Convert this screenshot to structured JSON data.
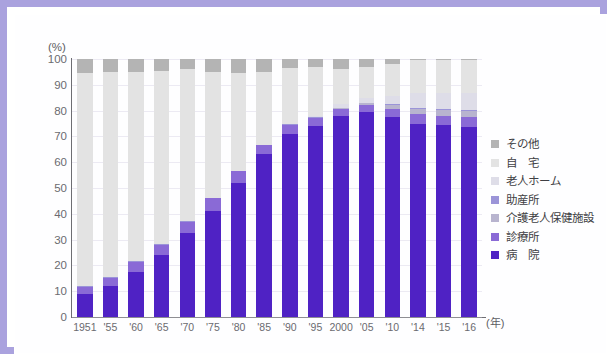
{
  "chart_data": {
    "type": "bar",
    "stacked": true,
    "title": "",
    "subtitle": "",
    "xlabel": "(年)",
    "ylabel": "(%)",
    "ylim": [
      0,
      100
    ],
    "ytick_step": 10,
    "yticks": [
      "100",
      "90",
      "80",
      "70",
      "60",
      "50",
      "40",
      "30",
      "20",
      "10",
      "0"
    ],
    "grid": true,
    "legend_position": "right",
    "categories": [
      "1951",
      "'55",
      "'60",
      "'65",
      "'70",
      "'75",
      "'80",
      "'85",
      "'90",
      "'95",
      "2000",
      "'05",
      "'10",
      "'14",
      "'15",
      "'16"
    ],
    "series": [
      {
        "name": "病 院",
        "color": "#4f22c4",
        "values": [
          9.0,
          12.0,
          17.5,
          24.0,
          32.5,
          41.0,
          52.0,
          63.0,
          71.0,
          74.0,
          78.0,
          79.5,
          77.5,
          75.0,
          74.5,
          73.5
        ]
      },
      {
        "name": "診療所",
        "color": "#8a6ad6",
        "values": [
          2.5,
          3.0,
          4.0,
          4.0,
          4.5,
          5.0,
          4.5,
          3.5,
          3.5,
          3.0,
          2.5,
          2.5,
          3.0,
          3.5,
          3.5,
          4.0
        ]
      },
      {
        "name": "介護老人保健施設",
        "color": "#b8b4cf",
        "values": [
          0.0,
          0.0,
          0.0,
          0.0,
          0.0,
          0.0,
          0.0,
          0.0,
          0.0,
          0.2,
          0.5,
          0.8,
          1.8,
          2.2,
          2.3,
          2.4
        ]
      },
      {
        "name": "助産所",
        "color": "#9b94d8",
        "values": [
          0.4,
          0.4,
          0.3,
          0.3,
          0.3,
          0.2,
          0.2,
          0.2,
          0.2,
          0.2,
          0.2,
          0.2,
          0.2,
          0.2,
          0.2,
          0.2
        ]
      },
      {
        "name": "老人ホーム",
        "color": "#dedde8",
        "values": [
          0.0,
          0.0,
          0.0,
          0.0,
          0.0,
          0.0,
          0.0,
          0.0,
          0.3,
          0.6,
          1.2,
          1.8,
          3.0,
          5.8,
          6.3,
          6.8
        ]
      },
      {
        "name": "自 宅",
        "color": "#e3e3e3",
        "values": [
          82.6,
          79.6,
          73.2,
          67.2,
          58.7,
          48.8,
          38.0,
          28.3,
          21.5,
          19.0,
          13.9,
          12.2,
          12.6,
          12.8,
          12.7,
          12.6
        ]
      },
      {
        "name": "その他",
        "color": "#b4b4b4",
        "values": [
          5.5,
          5.0,
          5.0,
          4.5,
          4.0,
          5.0,
          5.3,
          5.0,
          3.5,
          3.0,
          3.7,
          3.0,
          1.9,
          0.5,
          0.5,
          0.5
        ]
      }
    ],
    "legend_entries": [
      {
        "label": "その他",
        "color": "#b4b4b4"
      },
      {
        "label": "自　宅",
        "color": "#e3e3e3"
      },
      {
        "label": "老人ホーム",
        "color": "#dedde8"
      },
      {
        "label": "助産所",
        "color": "#9b94d8"
      },
      {
        "label": "介護老人保健施設",
        "color": "#b8b4cf"
      },
      {
        "label": "診療所",
        "color": "#8a6ad6"
      },
      {
        "label": "病　院",
        "color": "#4f22c4"
      }
    ],
    "frame_color": "#aaa2de",
    "axis_color": "#6e6e73",
    "grid_color": "#eceaf3"
  }
}
